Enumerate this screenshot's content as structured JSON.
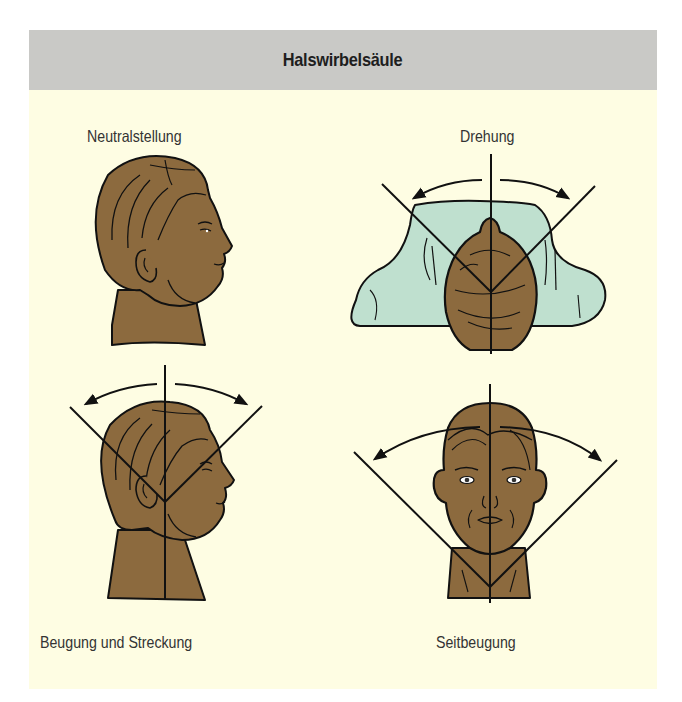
{
  "header": {
    "title": "Halswirbelsäule"
  },
  "colors": {
    "header_bg": "#c9c9c6",
    "panel_bg": "#fefde3",
    "skin": "#8c6a3e",
    "pillow": "#bfe0cf",
    "line": "#111111"
  },
  "figures": [
    {
      "id": "neutral",
      "label": "Neutralstellung",
      "view": "side profile, no reference lines"
    },
    {
      "id": "rotation",
      "label": "Drehung",
      "view": "top view of head on pillow with rotation angle lines and curved arrows"
    },
    {
      "id": "flexion-extension",
      "label": "Beugung und Streckung",
      "view": "side profile with vertical axis, angle lines and curved arrows"
    },
    {
      "id": "lateral-flexion",
      "label": "Seitbeugung",
      "view": "front view with vertical axis, angle lines and curved arrows"
    }
  ]
}
